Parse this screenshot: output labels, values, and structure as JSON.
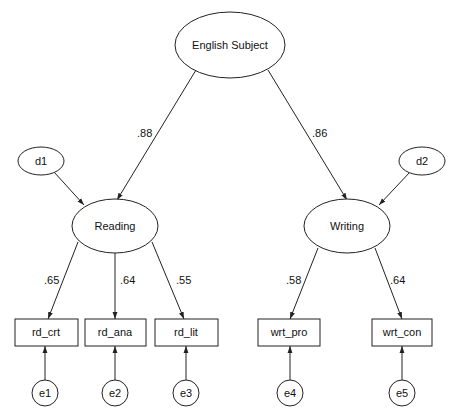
{
  "diagram": {
    "type": "structural-equation-model",
    "nodes": {
      "english": {
        "label": "English Subject",
        "shape": "ellipse"
      },
      "reading": {
        "label": "Reading",
        "shape": "ellipse"
      },
      "writing": {
        "label": "Writing",
        "shape": "ellipse"
      },
      "d1": {
        "label": "d1",
        "shape": "ellipse"
      },
      "d2": {
        "label": "d2",
        "shape": "ellipse"
      },
      "rd_crt": {
        "label": "rd_crt",
        "shape": "rect"
      },
      "rd_ana": {
        "label": "rd_ana",
        "shape": "rect"
      },
      "rd_lit": {
        "label": "rd_lit",
        "shape": "rect"
      },
      "wrt_pro": {
        "label": "wrt_pro",
        "shape": "rect"
      },
      "wrt_con": {
        "label": "wrt_con",
        "shape": "rect"
      },
      "e1": {
        "label": "e1",
        "shape": "circle"
      },
      "e2": {
        "label": "e2",
        "shape": "circle"
      },
      "e3": {
        "label": "e3",
        "shape": "circle"
      },
      "e4": {
        "label": "e4",
        "shape": "circle"
      },
      "e5": {
        "label": "e5",
        "shape": "circle"
      }
    },
    "edges": {
      "english_reading": {
        "from": "English Subject",
        "to": "Reading",
        "coef": ".88"
      },
      "english_writing": {
        "from": "English Subject",
        "to": "Writing",
        "coef": ".86"
      },
      "reading_rd_crt": {
        "from": "Reading",
        "to": "rd_crt",
        "coef": ".65"
      },
      "reading_rd_ana": {
        "from": "Reading",
        "to": "rd_ana",
        "coef": ".64"
      },
      "reading_rd_lit": {
        "from": "Reading",
        "to": "rd_lit",
        "coef": ".55"
      },
      "writing_wrt_pro": {
        "from": "Writing",
        "to": "wrt_pro",
        "coef": ".58"
      },
      "writing_wrt_con": {
        "from": "Writing",
        "to": "wrt_con",
        "coef": ".64"
      },
      "d1_reading": {
        "from": "d1",
        "to": "Reading"
      },
      "d2_writing": {
        "from": "d2",
        "to": "Writing"
      },
      "e1_rd_crt": {
        "from": "e1",
        "to": "rd_crt"
      },
      "e2_rd_ana": {
        "from": "e2",
        "to": "rd_ana"
      },
      "e3_rd_lit": {
        "from": "e3",
        "to": "rd_lit"
      },
      "e4_wrt_pro": {
        "from": "e4",
        "to": "wrt_pro"
      },
      "e5_wrt_con": {
        "from": "e5",
        "to": "wrt_con"
      }
    }
  }
}
